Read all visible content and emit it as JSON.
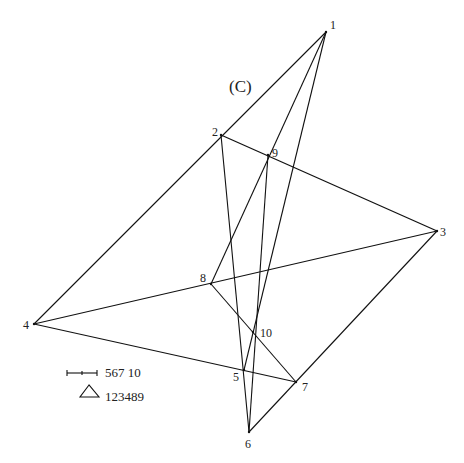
{
  "diagram": {
    "title": "(C)",
    "vertices": [
      {
        "id": "1",
        "label": "1",
        "x": 326,
        "y": 32,
        "lx": 330,
        "ly": 29
      },
      {
        "id": "2",
        "label": "2",
        "x": 221,
        "y": 135,
        "lx": 212,
        "ly": 136
      },
      {
        "id": "3",
        "label": "3",
        "x": 437,
        "y": 231,
        "lx": 440,
        "ly": 236
      },
      {
        "id": "4",
        "label": "4",
        "x": 34,
        "y": 324,
        "lx": 23,
        "ly": 329
      },
      {
        "id": "5",
        "label": "5",
        "x": 244,
        "y": 370,
        "lx": 233,
        "ly": 381
      },
      {
        "id": "6",
        "label": "6",
        "x": 249,
        "y": 432,
        "lx": 245,
        "ly": 448
      },
      {
        "id": "7",
        "label": "7",
        "x": 296,
        "y": 382,
        "lx": 302,
        "ly": 391
      },
      {
        "id": "8",
        "label": "8",
        "x": 211,
        "y": 284,
        "lx": 200,
        "ly": 282
      },
      {
        "id": "9",
        "label": "9",
        "x": 268,
        "y": 155,
        "lx": 272,
        "ly": 157
      },
      {
        "id": "10",
        "label": "10",
        "x": 253,
        "y": 332,
        "lx": 260,
        "ly": 337
      }
    ],
    "edges": [
      [
        "1",
        "4"
      ],
      [
        "1",
        "8"
      ],
      [
        "1",
        "5"
      ],
      [
        "2",
        "3"
      ],
      [
        "2",
        "6"
      ],
      [
        "9",
        "6"
      ],
      [
        "4",
        "3"
      ],
      [
        "4",
        "7"
      ],
      [
        "8",
        "7"
      ],
      [
        "3",
        "6"
      ]
    ],
    "legend": [
      {
        "symbol": "segment-with-ticks",
        "text": "567 10"
      },
      {
        "symbol": "triangle",
        "text": "123489"
      }
    ]
  }
}
